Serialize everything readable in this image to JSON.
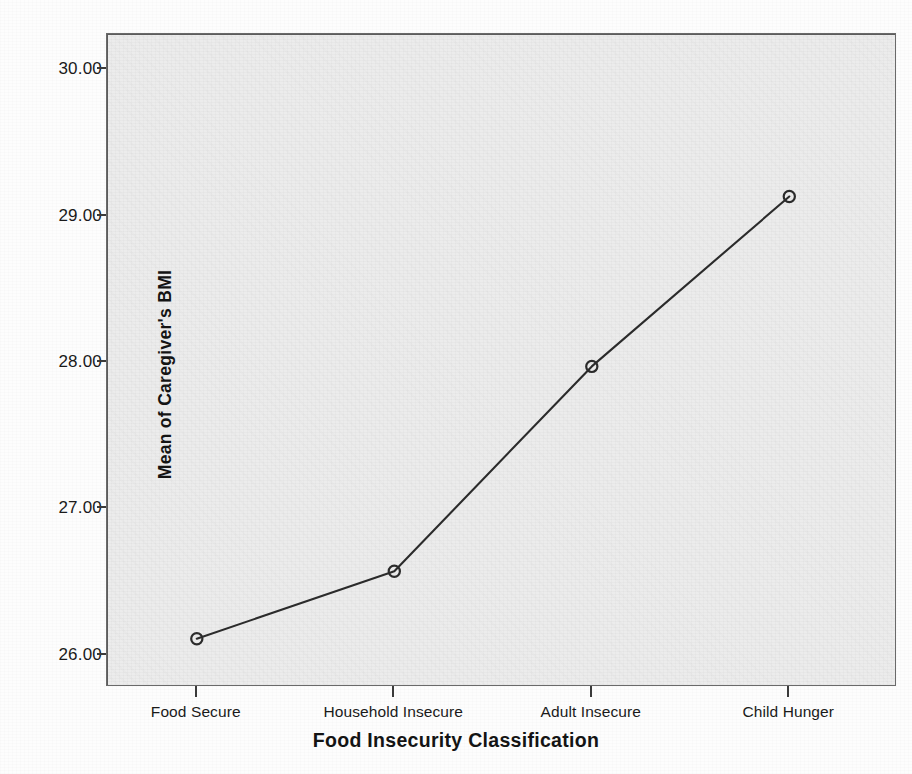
{
  "chart_data": {
    "type": "line",
    "title": "",
    "subtitle": "",
    "xlabel": "Food Insecurity Classification",
    "ylabel": "Mean of Caregiver's BMI",
    "categories": [
      "Food Secure",
      "Household Insecure",
      "Adult Insecure",
      "Child Hunger"
    ],
    "values": [
      26.11,
      26.57,
      27.97,
      29.13
    ],
    "series": [
      {
        "name": "Mean of Caregiver's BMI",
        "values": [
          26.11,
          26.57,
          27.97,
          29.13
        ]
      }
    ],
    "ylim": [
      25.78,
      30.24
    ],
    "ytick_labels": [
      "30.00",
      "29.00",
      "28.00",
      "27.00",
      "26.00"
    ],
    "ytick_values": [
      30.0,
      29.0,
      28.0,
      27.0,
      26.0
    ],
    "xtick_labels": [
      "Food Secure",
      "Household Insecure",
      "Adult Insecure",
      "Child Hunger"
    ],
    "grid": false,
    "legend": "none",
    "marker": "open-circle",
    "line_color": "#2b2b2b",
    "marker_color": "#2b2b2b",
    "plot_background_color": "#ececec",
    "page_background_color": "#fdfdfd",
    "axis_color": "#3a3a3a"
  },
  "axes": {
    "y": {
      "title": "Mean of Caregiver's BMI",
      "ticks": [
        {
          "label": "30.00",
          "value": 30.0
        },
        {
          "label": "29.00",
          "value": 29.0
        },
        {
          "label": "28.00",
          "value": 28.0
        },
        {
          "label": "27.00",
          "value": 27.0
        },
        {
          "label": "26.00",
          "value": 26.0
        }
      ]
    },
    "x": {
      "title": "Food Insecurity Classification",
      "ticks": [
        {
          "label": "Food Secure"
        },
        {
          "label": "Household Insecure"
        },
        {
          "label": "Adult Insecure"
        },
        {
          "label": "Child Hunger"
        }
      ]
    }
  }
}
